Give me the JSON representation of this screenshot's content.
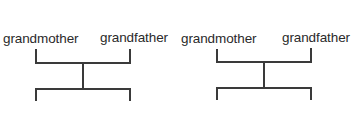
{
  "diagrams": [
    {
      "left_label": "grandmother",
      "right_label": "grandfather"
    },
    {
      "left_label": "grandmother",
      "right_label": "grandfather"
    }
  ],
  "colors": {
    "line": "#3a3a3a",
    "text": "#2a2a2a",
    "background": "#ffffff"
  }
}
